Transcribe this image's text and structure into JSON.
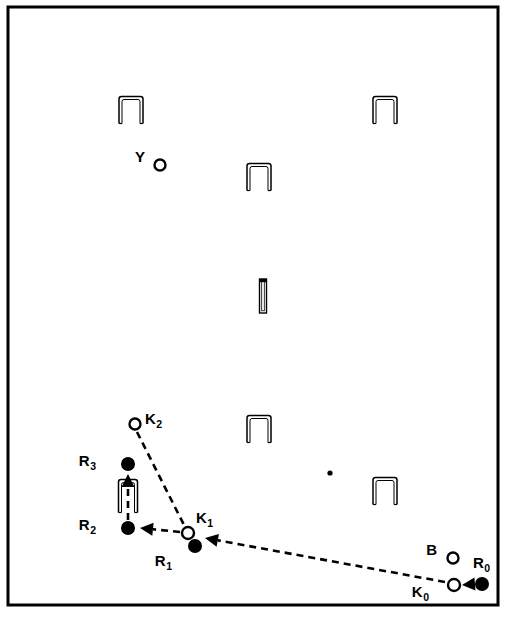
{
  "figure": {
    "background_color": "#ffffff",
    "ink_color": "#000000",
    "frame": {
      "name": "outer-border",
      "x": 8,
      "y": 7,
      "width": 490,
      "height": 598,
      "stroke_width": 3
    },
    "markers": [
      {
        "id": "Y",
        "label": "Y",
        "subscript": "",
        "style": "open-circle",
        "cx": 160,
        "cy": 165,
        "r": 5.5,
        "label_x": 145,
        "label_y": 162
      },
      {
        "id": "K2",
        "label": "K",
        "subscript": "2",
        "style": "open-circle",
        "cx": 135,
        "cy": 424,
        "r": 5.5,
        "label_x": 145,
        "label_y": 424
      },
      {
        "id": "R3",
        "label": "R",
        "subscript": "3",
        "style": "filled-circle",
        "cx": 128,
        "cy": 464,
        "r": 7.0,
        "label_x": 96,
        "label_y": 466
      },
      {
        "id": "R2",
        "label": "R",
        "subscript": "2",
        "style": "filled-circle",
        "cx": 128,
        "cy": 528,
        "r": 7.0,
        "label_x": 96,
        "label_y": 530
      },
      {
        "id": "K1",
        "label": "K",
        "subscript": "1",
        "style": "open-circle",
        "cx": 188,
        "cy": 533,
        "r": 6.0,
        "label_x": 196,
        "label_y": 523
      },
      {
        "id": "R1",
        "label": "R",
        "subscript": "1",
        "style": "filled-circle",
        "cx": 195,
        "cy": 546,
        "r": 7.0,
        "label_x": 172,
        "label_y": 566
      },
      {
        "id": "B",
        "label": "B",
        "subscript": "",
        "style": "open-circle",
        "cx": 453,
        "cy": 558,
        "r": 5.5,
        "label_x": 437,
        "label_y": 555
      },
      {
        "id": "K0",
        "label": "K",
        "subscript": "0",
        "style": "open-circle",
        "cx": 454,
        "cy": 585,
        "r": 6.0,
        "label_x": 429,
        "label_y": 597
      },
      {
        "id": "R0",
        "label": "R",
        "subscript": "0",
        "style": "filled-circle",
        "cx": 482,
        "cy": 584,
        "r": 7.0,
        "label_x": 473,
        "label_y": 568
      }
    ],
    "small_dot": {
      "name": "unlabeled-point",
      "cx": 330,
      "cy": 473,
      "r": 2.6
    },
    "staples": [
      {
        "name": "staple-upper-left",
        "x": 131,
        "y": 110,
        "w": 24,
        "h": 27,
        "shape": "inverted-u"
      },
      {
        "name": "staple-upper-right",
        "x": 385,
        "y": 110,
        "w": 24,
        "h": 27,
        "shape": "inverted-u"
      },
      {
        "name": "staple-upper-middle",
        "x": 259,
        "y": 177,
        "w": 24,
        "h": 27,
        "shape": "inverted-u"
      },
      {
        "name": "staple-center-bar",
        "x": 263,
        "y": 296,
        "w": 7,
        "h": 34,
        "shape": "vertical-bar"
      },
      {
        "name": "staple-mid-middle",
        "x": 259,
        "y": 429,
        "w": 24,
        "h": 27,
        "shape": "inverted-u"
      },
      {
        "name": "staple-mid-right",
        "x": 385,
        "y": 491,
        "w": 24,
        "h": 27,
        "shape": "inverted-u"
      },
      {
        "name": "staple-near-robot",
        "x": 128,
        "y": 496,
        "w": 19,
        "h": 33,
        "shape": "inverted-u"
      }
    ],
    "arrows": [
      {
        "name": "arrow-k0-to-k1",
        "from": "K0",
        "to": "K1",
        "x1": 445,
        "y1": 582,
        "x2": 205,
        "y2": 538,
        "dashed": true,
        "head": true
      },
      {
        "name": "arrow-k2-to-k1",
        "from": "K2",
        "to": "K1",
        "x1": 137,
        "y1": 432,
        "x2": 185,
        "y2": 527,
        "dashed": true,
        "head": false
      },
      {
        "name": "arrow-k1-to-r2",
        "from": "K1",
        "to": "R2",
        "x1": 180,
        "y1": 532,
        "x2": 140,
        "y2": 528,
        "dashed": true,
        "head": true
      },
      {
        "name": "arrow-r2-to-r3",
        "from": "R2",
        "to": "R3",
        "x1": 128,
        "y1": 520,
        "x2": 128,
        "y2": 474,
        "dashed": true,
        "head": true
      },
      {
        "name": "arrow-r0-to-k0",
        "from": "R0",
        "to": "K0",
        "x1": 475,
        "y1": 584,
        "x2": 462,
        "y2": 585,
        "dashed": false,
        "head": true
      }
    ]
  }
}
